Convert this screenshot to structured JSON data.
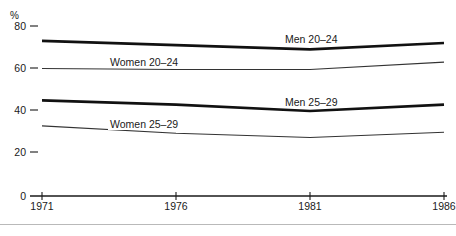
{
  "chart_data": {
    "type": "line",
    "title": "",
    "subtitle": "",
    "xlabel": "",
    "ylabel": "%",
    "unit_label": "%",
    "x": [
      1971,
      1976,
      1981,
      1986
    ],
    "xtick_labels": [
      "1971",
      "1976",
      "1981",
      "1986"
    ],
    "ytick_labels": [
      "80",
      "60",
      "40",
      "20",
      "0"
    ],
    "yticks": [
      80,
      60,
      40,
      20,
      0
    ],
    "ylim": [
      0,
      80
    ],
    "xlim": [
      1971,
      1986
    ],
    "grid": false,
    "legend_position": "inline-annotations",
    "series": [
      {
        "name": "Men 20–24",
        "label": "Men 20–24",
        "values": [
          73,
          71,
          69,
          72
        ],
        "color": "#111111",
        "line_width": 2.6,
        "label_x": 1980.2,
        "label_y": 75.5
      },
      {
        "name": "Women 20–24",
        "label": "Women 20–24",
        "values": [
          60,
          59.5,
          59.5,
          63
        ],
        "color": "#333333",
        "line_width": 1.1,
        "label_x": 1975.2,
        "label_y": 64.5
      },
      {
        "name": "Men 25–29",
        "label": "Men 25–29",
        "values": [
          45,
          43,
          40,
          43
        ],
        "color": "#111111",
        "line_width": 2.6,
        "label_x": 1980.2,
        "label_y": 46.5
      },
      {
        "name": "Women 25–29",
        "label": "Women 25–29",
        "values": [
          33,
          29.5,
          27.5,
          30
        ],
        "color": "#333333",
        "line_width": 1.1,
        "label_x": 1975.2,
        "label_y": 35.5
      }
    ]
  },
  "axis": {
    "unit": "%",
    "y_labels": [
      "80",
      "60",
      "40",
      "20",
      "0"
    ],
    "x_labels": [
      "1971",
      "1976",
      "1981",
      "1986"
    ]
  },
  "labels": {
    "men_20_24": "Men 20–24",
    "women_20_24": "Women 20–24",
    "men_25_29": "Men 25–29",
    "women_25_29": "Women 25–29"
  }
}
